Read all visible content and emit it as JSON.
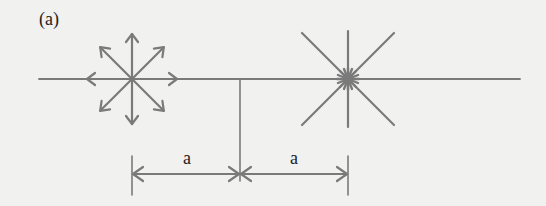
{
  "figure": {
    "panel_label": "(a)",
    "colors": {
      "background": "#f1f1ef",
      "stroke": "#7a7a7a",
      "text": "#222222"
    },
    "baseline": {
      "y": 79,
      "x_start": 39,
      "x_end": 520
    },
    "sources": [
      {
        "name": "diverging-source",
        "type": "outward-arrows",
        "cx": 132,
        "cy": 79,
        "arm_length": 45,
        "directions": 8
      },
      {
        "name": "converging-sink",
        "type": "plain-rays-with-hub",
        "cx": 348,
        "cy": 79,
        "arm_length": 48,
        "directions": 8
      }
    ],
    "midline": {
      "x": 240,
      "y_start": 79,
      "y_end": 181
    },
    "dimensions": [
      {
        "label": "a",
        "from_x": 132,
        "to_x": 240,
        "y": 174
      },
      {
        "label": "a",
        "from_x": 240,
        "to_x": 348,
        "y": 174
      }
    ]
  }
}
